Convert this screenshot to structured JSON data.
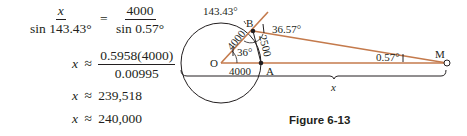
{
  "equations": {
    "line1": {
      "lhs_num": "x",
      "lhs_den": "sin 143.43°",
      "op": "=",
      "rhs_num": "4000",
      "rhs_den": "sin 0.57°"
    },
    "line2": {
      "var": "x",
      "op": "≈",
      "num": "0.5958(4000)",
      "den": "0.00995"
    },
    "line3": {
      "var": "x",
      "op": "≈",
      "value": "239,518"
    },
    "line4": {
      "var": "x",
      "op": "≈",
      "value": "240,000"
    }
  },
  "figure": {
    "caption": "Figure 6-13",
    "colors": {
      "line": "#c47a4c",
      "ink": "#231f20"
    },
    "points": {
      "O": "O",
      "A": "A",
      "B": "B",
      "M": "M"
    },
    "labels": {
      "angle_exterior": "143.43°",
      "angle_B": "36.57°",
      "angle_O": "36°",
      "angle_M": "0.57°",
      "side_OB": "4000",
      "side_OA": "4000",
      "side_BA": "2500",
      "distance": "x"
    }
  }
}
